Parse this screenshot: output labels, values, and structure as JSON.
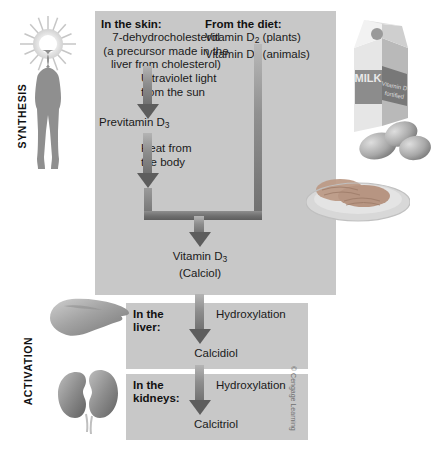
{
  "figure": {
    "stages": [
      {
        "id": "synthesis",
        "label": "SYNTHESIS"
      },
      {
        "id": "activation",
        "label": "ACTIVATION"
      }
    ],
    "synthesis_panel": {
      "skin": {
        "heading": "In the skin:",
        "compound": "7-dehydrocholesterol",
        "note_line1": "(a precursor made in the",
        "note_line2": "liver from cholesterol)"
      },
      "diet": {
        "heading": "From the diet:",
        "items": [
          {
            "name": "Vitamin D",
            "subscript": "2",
            "source": "(plants)"
          },
          {
            "name": "Vitamin D",
            "subscript": "3",
            "source": "(animals)"
          }
        ]
      },
      "steps": [
        {
          "label_line1": "Ultraviolet light",
          "label_line2": "from the sun"
        },
        {
          "label_line1": "Heat from",
          "label_line2": "the body"
        }
      ],
      "intermediate": {
        "name": "Previtamin D",
        "subscript": "3"
      },
      "product": {
        "name": "Vitamin D",
        "subscript": "3",
        "alias": "(Calciol)"
      }
    },
    "activation_panels": [
      {
        "id": "liver",
        "heading_line1": "In the",
        "heading_line2": "liver:",
        "reaction": "Hydroxylation",
        "product": "Calcidiol",
        "organ_icon": "liver-icon"
      },
      {
        "id": "kidneys",
        "heading_line1": "In the",
        "heading_line2": "kidneys:",
        "reaction": "Hydroxylation",
        "product": "Calcitriol",
        "organ_icon": "kidneys-icon"
      }
    ],
    "illustrations": {
      "sun": "sun-icon",
      "human": "human-silhouette-icon",
      "milk_carton": {
        "icon": "milk-carton-icon",
        "brand_text": "MILK",
        "fortified_line1": "Vitamin D",
        "fortified_line2": "fortified"
      },
      "eggs": "eggs-icon",
      "fish_plate": "fish-plate-icon"
    },
    "copyright": "© Cengage Learning",
    "colors": {
      "panel_gray": "#c8c8c8",
      "arrow_dark": "#5d5d5d",
      "arrow_light": "#b4b4b4",
      "text": "#1a1a1a",
      "background": "#ffffff"
    }
  }
}
